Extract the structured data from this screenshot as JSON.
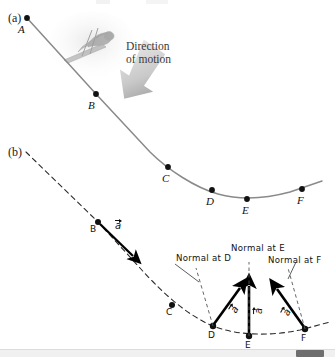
{
  "figure": {
    "panels": [
      {
        "id": "a",
        "label": "(a)"
      },
      {
        "id": "b",
        "label": "(b)"
      }
    ],
    "annotation": {
      "direction_line1": "Direction",
      "direction_line2": "of motion",
      "arrow_icon": "motion-arrow-icon"
    }
  },
  "panel_a": {
    "curve_points": [
      {
        "name": "A",
        "label": "A",
        "x": 27,
        "y": 18
      },
      {
        "name": "B",
        "label": "B",
        "x": 96,
        "y": 94
      },
      {
        "name": "C",
        "label": "C",
        "x": 168,
        "y": 167
      },
      {
        "name": "D",
        "label": "D",
        "x": 212,
        "y": 190
      },
      {
        "name": "E",
        "label": "E",
        "x": 247,
        "y": 199
      },
      {
        "name": "F",
        "label": "F",
        "x": 302,
        "y": 189
      }
    ],
    "skier_icon": "skier-figure-icon"
  },
  "panel_b": {
    "curve_points": [
      {
        "name": "B",
        "label": "B",
        "x": 98,
        "y": 222
      },
      {
        "name": "C",
        "label": "C",
        "x": 172,
        "y": 305
      },
      {
        "name": "D",
        "label": "D",
        "x": 213,
        "y": 326
      },
      {
        "name": "E",
        "label": "E",
        "x": 249,
        "y": 336
      },
      {
        "name": "F",
        "label": "F",
        "x": 305,
        "y": 329
      }
    ],
    "acceleration_vectors": [
      {
        "at": "B",
        "label": "a",
        "symbol": "vector-a-icon"
      },
      {
        "at": "D",
        "label": "a",
        "symbol": "vector-a-icon"
      },
      {
        "at": "E",
        "label": "a",
        "symbol": "vector-a-icon"
      },
      {
        "at": "F",
        "label": "a",
        "symbol": "vector-a-icon"
      }
    ],
    "normal_labels": [
      {
        "id": "normal-at-d",
        "text": "Normal at D"
      },
      {
        "id": "normal-at-e",
        "text": "Normal at E"
      },
      {
        "id": "normal-at-f",
        "text": "Normal at F"
      }
    ]
  },
  "scrollbar": {
    "orientation": "horizontal",
    "thumb_left": 296,
    "thumb_width": 28,
    "track_color": "#f0f0f0",
    "thumb_color": "#6e6e6e"
  },
  "colors": {
    "curve_solid": "#8a8a8a",
    "curve_dashed": "#2b2b2b",
    "point_fill": "#111111",
    "vector": "#000000",
    "motion_arrow": "#b8b8b8",
    "text": "#1a1a1a"
  }
}
